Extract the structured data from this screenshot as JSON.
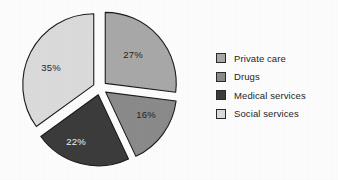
{
  "chart_data": {
    "type": "pie",
    "title": "",
    "labels": [
      "Private care",
      "Drugs",
      "Medical services",
      "Social services"
    ],
    "values": [
      27,
      16,
      22,
      35
    ],
    "value_labels": [
      "27%",
      "16%",
      "22%",
      "35%"
    ],
    "units": "percent",
    "total": 100,
    "exploded": true,
    "start_angle_deg": 0,
    "direction": "clockwise",
    "legend_position": "right",
    "grid": false,
    "colors": [
      "#a9a9a9",
      "#8b8b8b",
      "#3c3c3c",
      "#dcdcdc"
    ],
    "label_text_colors": [
      "#1f1f1f",
      "#1f1f1f",
      "#f2f2f2",
      "#1f1f1f"
    ],
    "outline_color": "#1c1c1c",
    "background": "#fefefe",
    "slices": [
      {
        "name": "Private care",
        "value": 27,
        "display": "27%",
        "color": "#a9a9a9",
        "label_color": "#1f1f1f",
        "start_deg": 0,
        "end_deg": 97.2,
        "label_x": 133,
        "label_y": 55
      },
      {
        "name": "Drugs",
        "value": 16,
        "display": "16%",
        "color": "#8b8b8b",
        "label_color": "#1f1f1f",
        "start_deg": 97.2,
        "end_deg": 154.8,
        "label_x": 146,
        "label_y": 115
      },
      {
        "name": "Medical services",
        "value": 22,
        "display": "22%",
        "color": "#3c3c3c",
        "label_color": "#f2f2f2",
        "start_deg": 154.8,
        "end_deg": 234.0,
        "label_x": 76,
        "label_y": 142
      },
      {
        "name": "Social services",
        "value": 35,
        "display": "35%",
        "color": "#dcdcdc",
        "label_color": "#1f1f1f",
        "start_deg": 234.0,
        "end_deg": 360.0,
        "label_x": 51,
        "label_y": 68
      }
    ]
  },
  "legend": {
    "items": [
      {
        "label": "Private care",
        "color": "#a9a9a9"
      },
      {
        "label": "Drugs",
        "color": "#8b8b8b"
      },
      {
        "label": "Medical services",
        "color": "#3c3c3c"
      },
      {
        "label": "Social services",
        "color": "#dcdcdc"
      }
    ]
  }
}
